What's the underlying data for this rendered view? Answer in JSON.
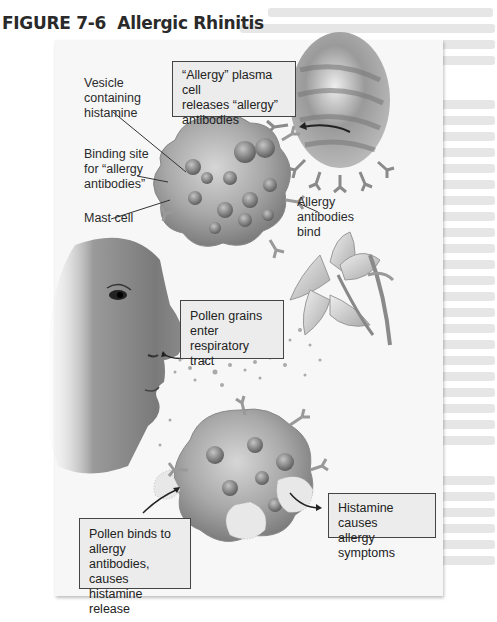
{
  "figure": {
    "number": "FIGURE 7-6",
    "title": "Allergic Rhinitis"
  },
  "labels": {
    "vesicle": [
      "Vesicle",
      "containing",
      "histamine"
    ],
    "binding_site": [
      "Binding site",
      "for “allergy",
      "antibodies”"
    ],
    "mast_cell": "Mast cell",
    "allergy_antibodies_bind": [
      "Allergy",
      "antibodies",
      "bind"
    ]
  },
  "callouts": {
    "plasma_cell": [
      "“Allergy” plasma cell",
      "releases “allergy”",
      "antibodies"
    ],
    "pollen_enter": [
      "Pollen grains",
      "enter respiratory",
      "tract"
    ],
    "pollen_binds": [
      "Pollen binds to",
      "allergy antibodies,",
      "causes histamine",
      "release"
    ],
    "histamine_causes": [
      "Histamine causes",
      "allergy symptoms"
    ]
  },
  "colors": {
    "panel_bg": "#f7f7f7",
    "callout_bg": "#ececec",
    "callout_border": "#444444",
    "cell_fill": "#9a9a9a",
    "title_text": "#2a2a2a"
  }
}
